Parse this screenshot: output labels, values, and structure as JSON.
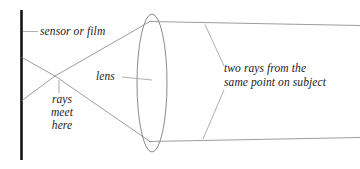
{
  "diagram": {
    "background_color": "#ffffff",
    "ray_color": "#8a8a8a",
    "leader_color": "#9a9a9a",
    "sensor_color": "#111111",
    "lens_color": "#7d7d7d",
    "text_color": "#1b1b1b"
  },
  "labels": {
    "sensor": "sensor or film",
    "lens": "lens",
    "rays_meet": {
      "line1": "rays",
      "line2": "meet",
      "line3": "here"
    },
    "two_rays": {
      "line1": "two rays from the",
      "line2": "same point on subject"
    }
  },
  "geometry": {
    "sensor": {
      "x": 21,
      "y_top": 10,
      "y_bottom": 160
    },
    "crossing_point": {
      "x": 55,
      "y": 76
    },
    "lens": {
      "cx": 152,
      "cy": 83,
      "rx": 15,
      "ry": 69
    },
    "ray_upper_sensor_y": 58,
    "ray_lower_sensor_y": 100,
    "ray_upper_right_y": 23,
    "ray_lower_right_y": 139,
    "canvas": {
      "width": 360,
      "height": 169
    }
  }
}
